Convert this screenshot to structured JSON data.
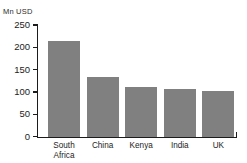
{
  "chart_data": {
    "type": "bar",
    "title": "",
    "subtitle": "",
    "xlabel": "",
    "ylabel": "Mn USD",
    "categories": [
      "South Africa",
      "China",
      "Kenya",
      "India",
      "UK"
    ],
    "values": [
      215,
      134,
      112,
      107,
      103
    ],
    "series": [
      {
        "name": "Mn USD",
        "values": [
          215,
          134,
          112,
          107,
          103
        ]
      }
    ],
    "ylim": [
      0,
      250
    ],
    "yticks": [
      0,
      50,
      100,
      150,
      200,
      250
    ],
    "ytick_labels": [
      "0",
      "50",
      "100",
      "150",
      "200",
      "250"
    ],
    "grid": false,
    "legend": false,
    "legend_position": "none",
    "bar_color": "#808080",
    "axis_color": "#1c1c1c",
    "background_color": "#ffffff",
    "annotations": []
  },
  "axis": {
    "unit_label": "Mn USD"
  }
}
